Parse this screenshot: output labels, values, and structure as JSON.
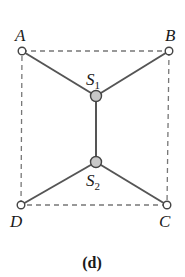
{
  "caption": "(d)",
  "colors": {
    "edge": "#555555",
    "dashed": "#777777",
    "terminal_fill": "#ffffff",
    "steiner_fill": "#c8c8c8",
    "text": "#1a1a1a"
  },
  "nodes": {
    "A": {
      "label": "A",
      "type": "terminal"
    },
    "B": {
      "label": "B",
      "type": "terminal"
    },
    "C": {
      "label": "C",
      "type": "terminal"
    },
    "D": {
      "label": "D",
      "type": "terminal"
    },
    "S1": {
      "label": "S",
      "subscript": "1",
      "type": "steiner"
    },
    "S2": {
      "label": "S",
      "subscript": "2",
      "type": "steiner"
    }
  },
  "edges": [
    {
      "from": "A",
      "to": "S1",
      "style": "solid"
    },
    {
      "from": "B",
      "to": "S1",
      "style": "solid"
    },
    {
      "from": "S1",
      "to": "S2",
      "style": "solid"
    },
    {
      "from": "S2",
      "to": "D",
      "style": "solid"
    },
    {
      "from": "S2",
      "to": "C",
      "style": "solid"
    },
    {
      "from": "A",
      "to": "B",
      "style": "dashed"
    },
    {
      "from": "B",
      "to": "C",
      "style": "dashed"
    },
    {
      "from": "C",
      "to": "D",
      "style": "dashed"
    },
    {
      "from": "D",
      "to": "A",
      "style": "dashed"
    }
  ]
}
